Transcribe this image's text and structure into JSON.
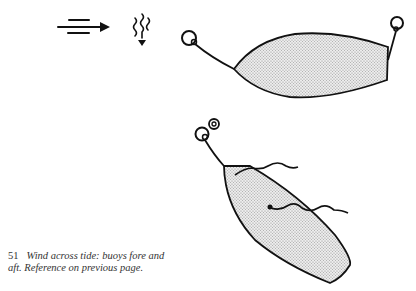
{
  "figure": {
    "number": "51",
    "caption_line1": "Wind across tide: buoys fore and",
    "caption_line2": "aft. Reference on previous page."
  },
  "legend_icons": {
    "wind": "wind-arrow-icon",
    "tide": "tide-wavy-arrow-icon"
  },
  "boats": [
    {
      "label": "boat-moored-fore-and-aft",
      "buoys": 2
    },
    {
      "label": "boat-swung-by-wind-and-tide",
      "buoys": 2
    }
  ],
  "colors": {
    "ink": "#111111",
    "hull_fill": "#d9d9d9",
    "background": "#ffffff"
  }
}
